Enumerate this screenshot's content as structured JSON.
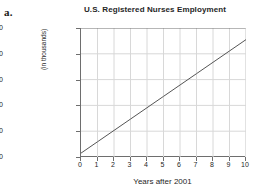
{
  "part_label": "a.",
  "chart_data": {
    "type": "line",
    "title": "U.S. Registered Nurses Employment",
    "xlabel": "Years after 2001",
    "ylabel": "(in thousands)",
    "xlim": [
      0,
      10
    ],
    "ylim": [
      2200,
      2700
    ],
    "xticks": [
      0,
      1,
      2,
      3,
      4,
      5,
      6,
      7,
      8,
      9,
      10
    ],
    "yticks": [
      2200,
      2300,
      2400,
      2500,
      2600,
      2700
    ],
    "xtick_labels": [
      "0",
      "1",
      "2",
      "3",
      "4",
      "5",
      "6",
      "7",
      "8",
      "9",
      "10"
    ],
    "ytick_labels": [
      "2200",
      "2300",
      "2400",
      "2500",
      "2600",
      "2700"
    ],
    "grid": true,
    "legend": "none",
    "line_color": "#555555",
    "grid_color": "#d8d8d8",
    "axis_color": "#6e6e6e",
    "series": [
      {
        "name": "Registered nurses employed",
        "x": [
          0,
          1,
          2,
          3,
          4,
          5,
          6,
          7,
          8,
          9,
          10
        ],
        "values": [
          2215,
          2259,
          2303,
          2347,
          2391,
          2435,
          2479,
          2523,
          2567,
          2611,
          2655
        ]
      }
    ]
  }
}
